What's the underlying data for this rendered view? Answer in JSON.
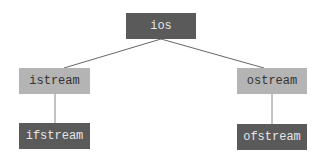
{
  "diagram": {
    "type": "class-hierarchy",
    "nodes": {
      "ios": {
        "label": "ios",
        "fill": "#5a5a5a",
        "text_color": "#e6e6e6"
      },
      "istream": {
        "label": "istream",
        "fill": "#b4b4b4",
        "text_color": "#333333"
      },
      "ostream": {
        "label": "ostream",
        "fill": "#b4b4b4",
        "text_color": "#333333"
      },
      "ifstream": {
        "label": "ifstream",
        "fill": "#5a5a5a",
        "text_color": "#e6e6e6"
      },
      "ofstream": {
        "label": "ofstream",
        "fill": "#5a5a5a",
        "text_color": "#e6e6e6"
      }
    },
    "edges": [
      {
        "from": "ios",
        "to": "istream"
      },
      {
        "from": "ios",
        "to": "ostream"
      },
      {
        "from": "istream",
        "to": "ifstream"
      },
      {
        "from": "ostream",
        "to": "ofstream"
      }
    ],
    "line_color": "#666666"
  }
}
